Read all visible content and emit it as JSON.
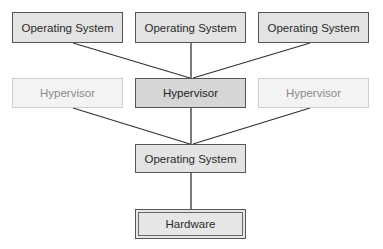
{
  "diagram": {
    "guest_os": [
      {
        "label": "Operating System"
      },
      {
        "label": "Operating System"
      },
      {
        "label": "Operating System"
      }
    ],
    "hypervisors": [
      {
        "label": "Hypervisor",
        "state": "faded"
      },
      {
        "label": "Hypervisor",
        "state": "active"
      },
      {
        "label": "Hypervisor",
        "state": "faded"
      }
    ],
    "host_os": {
      "label": "Operating System"
    },
    "hardware": {
      "label": "Hardware"
    },
    "colors": {
      "box_fill": "#e3e3e3",
      "active_fill": "#d6d6d6",
      "faded_fill": "#f3f3f3",
      "faded_text": "#8a8a8a",
      "line": "#333333"
    }
  }
}
